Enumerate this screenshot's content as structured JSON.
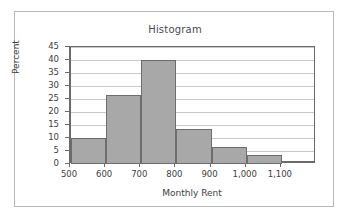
{
  "chart_data": {
    "type": "bar",
    "title": "Histogram",
    "xlabel": "Monthly Rent",
    "ylabel": "Percent",
    "grid": true,
    "legend": false,
    "bin_edges": [
      500,
      600,
      700,
      800,
      900,
      1000,
      1100
    ],
    "categories": [
      "500-600",
      "600-700",
      "700-800",
      "800-900",
      "900-1,000",
      "1,000-1,100"
    ],
    "values": [
      10.0,
      26.7,
      40.0,
      13.3,
      6.7,
      3.3
    ],
    "xlim": [
      500,
      1200
    ],
    "ylim": [
      0,
      45
    ],
    "xticks": [
      500,
      600,
      700,
      800,
      900,
      1000,
      1100
    ],
    "xtick_labels": [
      "500",
      "600",
      "700",
      "800",
      "900",
      "1,000",
      "1,100"
    ],
    "yticks": [
      0,
      5,
      10,
      15,
      20,
      25,
      30,
      35,
      40,
      45
    ],
    "ytick_labels": [
      "0",
      "5",
      "10",
      "15",
      "20",
      "25",
      "30",
      "35",
      "40",
      "45"
    ],
    "bar_fill_color": "#a8a8a8",
    "bar_edge_color": "#6d6d6d",
    "axis_color": "#6a6a6a",
    "grid_color": "#c9c9c9",
    "border_color": "#b9b9bb"
  }
}
